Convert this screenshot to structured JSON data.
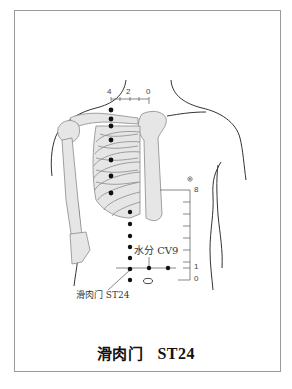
{
  "figure": {
    "caption_name": "滑肉门",
    "caption_code": "ST24",
    "point_label": "滑肉门 ST24",
    "reference_label": "水分 CV9",
    "top_scale_ticks": [
      "4",
      "2",
      "0"
    ],
    "side_scale_ticks": [
      "8",
      "1",
      "0"
    ],
    "colors": {
      "line": "#333333",
      "bone_fill": "#e6e6e6",
      "bone_stroke": "#8a8a8a",
      "dot": "#111111",
      "frame": "#9a9a9a"
    }
  }
}
